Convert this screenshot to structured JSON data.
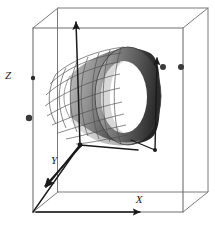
{
  "figure": {
    "background_color": "#ffffff",
    "width": 215,
    "height": 229
  },
  "axes": {
    "x": {
      "label": "X",
      "label_x": 136,
      "label_y": 203,
      "direction": "right-along-bottom-edge",
      "arrow_tip": [
        171,
        212
      ]
    },
    "y": {
      "label": "Y",
      "label_x": 54,
      "label_y": 164,
      "direction": "down-left-toward-viewer",
      "arrow_tip": [
        44,
        190
      ]
    },
    "z": {
      "label": "Z",
      "label_x": 8,
      "label_y": 75,
      "direction": "up-vertical",
      "arrow_tip": [
        75,
        20
      ]
    },
    "origin": [
      80,
      145
    ],
    "second_origin": [
      155,
      150
    ],
    "color": "#1a1a1a"
  },
  "box": {
    "name": "bounding-box",
    "stroke": "#6e6e6e",
    "stroke_width": 1,
    "front_face": {
      "left": 33,
      "top": 28,
      "right": 183,
      "bottom": 212
    },
    "back_face": {
      "left": 58,
      "top": 8,
      "right": 208,
      "bottom": 192
    }
  },
  "cylinder": {
    "name": "shaded-cylinder",
    "mesh_side": "near-left-wireframe",
    "solid_side": "far-right-shaded",
    "mesh_stroke": "#5a5a5a",
    "shading": {
      "highlight": "#d8d8d8",
      "mid": "#8f8f8f",
      "shadow": "#2a2a2a",
      "interior": "#ffffff"
    },
    "far_rim_center": [
      128,
      96
    ],
    "far_rim_rx": 32,
    "far_rim_ry": 48,
    "near_rim_center": [
      70,
      118
    ],
    "near_rim_rx": 26,
    "near_rim_ry": 42
  },
  "markers": [
    {
      "name": "point-marker-left",
      "x": 29,
      "y": 118,
      "r": 3.2,
      "color": "#3a3a3a"
    },
    {
      "name": "point-marker-upper-middle",
      "x": 163,
      "y": 67,
      "r": 3.0,
      "color": "#3a3a3a"
    },
    {
      "name": "point-marker-upper-right",
      "x": 181,
      "y": 67,
      "r": 3.0,
      "color": "#3a3a3a"
    },
    {
      "name": "tick-marker-z-axis",
      "x": 33,
      "y": 78,
      "r": 2.2,
      "color": "#2a2a2a"
    }
  ],
  "colors": {
    "ink": "#1a1a1a",
    "box_line": "#6e6e6e",
    "mesh_line": "#5a5a5a",
    "shade_dark": "#2a2a2a",
    "shade_light": "#d8d8d8",
    "background": "#ffffff"
  }
}
